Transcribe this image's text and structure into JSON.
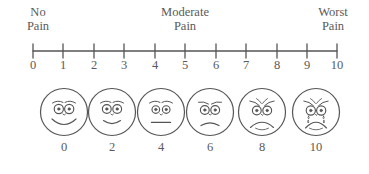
{
  "figure": {
    "name": "numeric-and-faces-pain-rating-scale",
    "stroke_color": "#555555",
    "text_color": "#5a5a5a",
    "background_color": "#ffffff"
  },
  "anchors": {
    "left": {
      "line1": "No",
      "line2": "Pain"
    },
    "middle": {
      "line1": "Moderate",
      "line2": "Pain"
    },
    "right": {
      "line1": "Worst",
      "line2": "Pain"
    }
  },
  "numeric_scale": {
    "ticks": [
      {
        "label": "0",
        "value": 0,
        "x": 33
      },
      {
        "label": "1",
        "value": 1,
        "x": 63
      },
      {
        "label": "2",
        "value": 2,
        "x": 94
      },
      {
        "label": "3",
        "value": 3,
        "x": 124
      },
      {
        "label": "4",
        "value": 4,
        "x": 155
      },
      {
        "label": "5",
        "value": 5,
        "x": 185
      },
      {
        "label": "6",
        "value": 6,
        "x": 216
      },
      {
        "label": "7",
        "value": 7,
        "x": 246
      },
      {
        "label": "8",
        "value": 8,
        "x": 277
      },
      {
        "label": "9",
        "value": 9,
        "x": 307
      },
      {
        "label": "10",
        "value": 10,
        "x": 337
      }
    ],
    "axis_y": 13,
    "axis_x_start": 33,
    "axis_x_end": 337,
    "tick_half_height": 7
  },
  "faces": [
    {
      "label": "0",
      "value": 0,
      "x": 64,
      "expression": "broad-smile",
      "icon": "face-smiling-icon"
    },
    {
      "label": "2",
      "value": 2,
      "x": 112,
      "expression": "slight-smile",
      "icon": "face-slight-smile-icon"
    },
    {
      "label": "4",
      "value": 4,
      "x": 161,
      "expression": "neutral",
      "icon": "face-neutral-icon"
    },
    {
      "label": "6",
      "value": 6,
      "x": 210,
      "expression": "slight-frown",
      "icon": "face-slight-frown-icon"
    },
    {
      "label": "8",
      "value": 8,
      "x": 262,
      "expression": "deep-frown",
      "icon": "face-distressed-icon"
    },
    {
      "label": "10",
      "value": 10,
      "x": 316,
      "expression": "crying-with-tears",
      "icon": "face-crying-icon"
    }
  ],
  "chart_data": {
    "type": "scale",
    "xlabel": "",
    "ylabel": "",
    "xlim": [
      0,
      10
    ],
    "grid": false,
    "legend": "none",
    "categories": [
      "0",
      "1",
      "2",
      "3",
      "4",
      "5",
      "6",
      "7",
      "8",
      "9",
      "10"
    ],
    "values": [
      0,
      1,
      2,
      3,
      4,
      5,
      6,
      7,
      8,
      9,
      10
    ],
    "annotations": [
      "No Pain",
      "Moderate Pain",
      "Worst Pain"
    ],
    "face_categories": [
      "0",
      "2",
      "4",
      "6",
      "8",
      "10"
    ],
    "face_expressions": [
      "broad-smile",
      "slight-smile",
      "neutral",
      "slight-frown",
      "deep-frown",
      "crying-with-tears"
    ]
  }
}
